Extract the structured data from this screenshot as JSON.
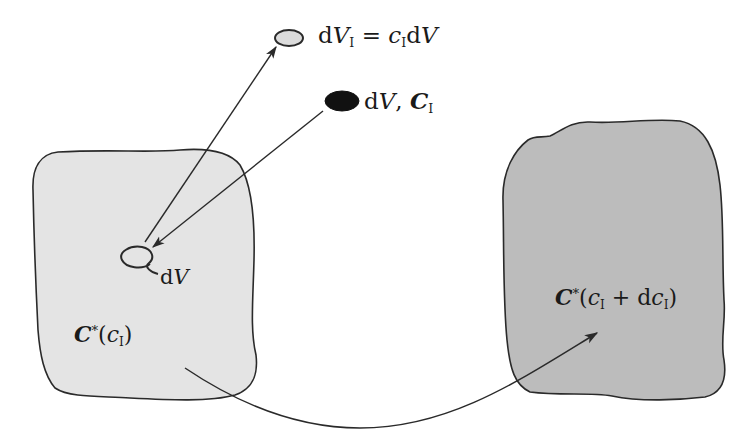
{
  "figure": {
    "type": "continuum-mechanics-configuration-diagram",
    "colors": {
      "background": "#ffffff",
      "stroke": "#2a2a2a",
      "left_body_fill": "#e4e4e4",
      "right_body_fill": "#bcbcbc",
      "light_element_fill": "#dcdcdc",
      "dark_element_fill": "#111111"
    }
  },
  "labels": {
    "top_element": {
      "d": "d",
      "V": "V",
      "V_sub": "I",
      "eq": " = ",
      "c": "c",
      "c_sub": "I",
      "tail": "d",
      "tailV": "V"
    },
    "dark_element": {
      "d": "d",
      "V": "V",
      "comma": ", ",
      "C": "C",
      "C_sub": "I"
    },
    "loop_element": {
      "d": "d",
      "V": "V"
    },
    "left_body": {
      "C": "C",
      "star": "*",
      "open": "(",
      "c": "c",
      "c_sub": "I",
      "close": ")"
    },
    "right_body": {
      "C": "C",
      "star": "*",
      "open": "(",
      "c": "c",
      "c_sub": "I",
      "plus": " + d",
      "c2": "c",
      "c2_sub": "I",
      "close": ")"
    }
  }
}
